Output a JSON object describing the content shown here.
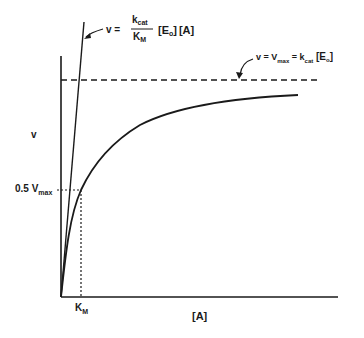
{
  "diagram": {
    "type": "michaelis-menten-kinetics",
    "y_axis_label": "v",
    "x_axis_label": "[A]",
    "y_tick_label": {
      "base": "0.5 V",
      "sub": "max"
    },
    "x_tick_label": {
      "base": "K",
      "sub": "M"
    },
    "initial_slope_annotation": {
      "lhs": "v =",
      "numerator": {
        "base": "k",
        "sub": "cat"
      },
      "denominator": {
        "base": "K",
        "sub": "M"
      },
      "rhs_e": {
        "open": "[E",
        "sub": "o",
        "close": "]"
      },
      "rhs_a": "[A]"
    },
    "asymptote_annotation": {
      "lhs": "v = V",
      "vsub": "max",
      "mid": " = k",
      "ksub": "cat",
      "e_open": " [E",
      "e_sub": "o",
      "e_close": "]"
    },
    "colors": {
      "ink": "#1a1a1a",
      "background": "#ffffff"
    }
  }
}
